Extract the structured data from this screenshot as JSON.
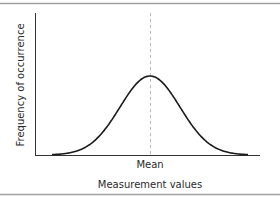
{
  "chart_data": {
    "type": "line",
    "title": "",
    "xlabel": "Measurement values",
    "ylabel": "Frequency of occurrence",
    "x_tick_labels": [
      "Mean"
    ],
    "annotations": [
      {
        "type": "vertical-dashed-line",
        "at": "Mean"
      }
    ],
    "series": [
      {
        "name": "Normal distribution",
        "shape": "gaussian bell curve",
        "x": [
          -3,
          -2.5,
          -2,
          -1.5,
          -1,
          -0.5,
          0,
          0.5,
          1,
          1.5,
          2,
          2.5,
          3
        ],
        "values": [
          0.011,
          0.044,
          0.135,
          0.325,
          0.607,
          0.882,
          1.0,
          0.882,
          0.607,
          0.325,
          0.135,
          0.044,
          0.011
        ]
      }
    ],
    "grid": false,
    "legend": "none",
    "peak_relative_height": 0.56
  },
  "colors": {
    "curve": "#1a1a1a",
    "axes": "#333333",
    "mean_line": "#b8b8b8",
    "border": "#9a9a9a",
    "text": "#2a2a2a"
  }
}
